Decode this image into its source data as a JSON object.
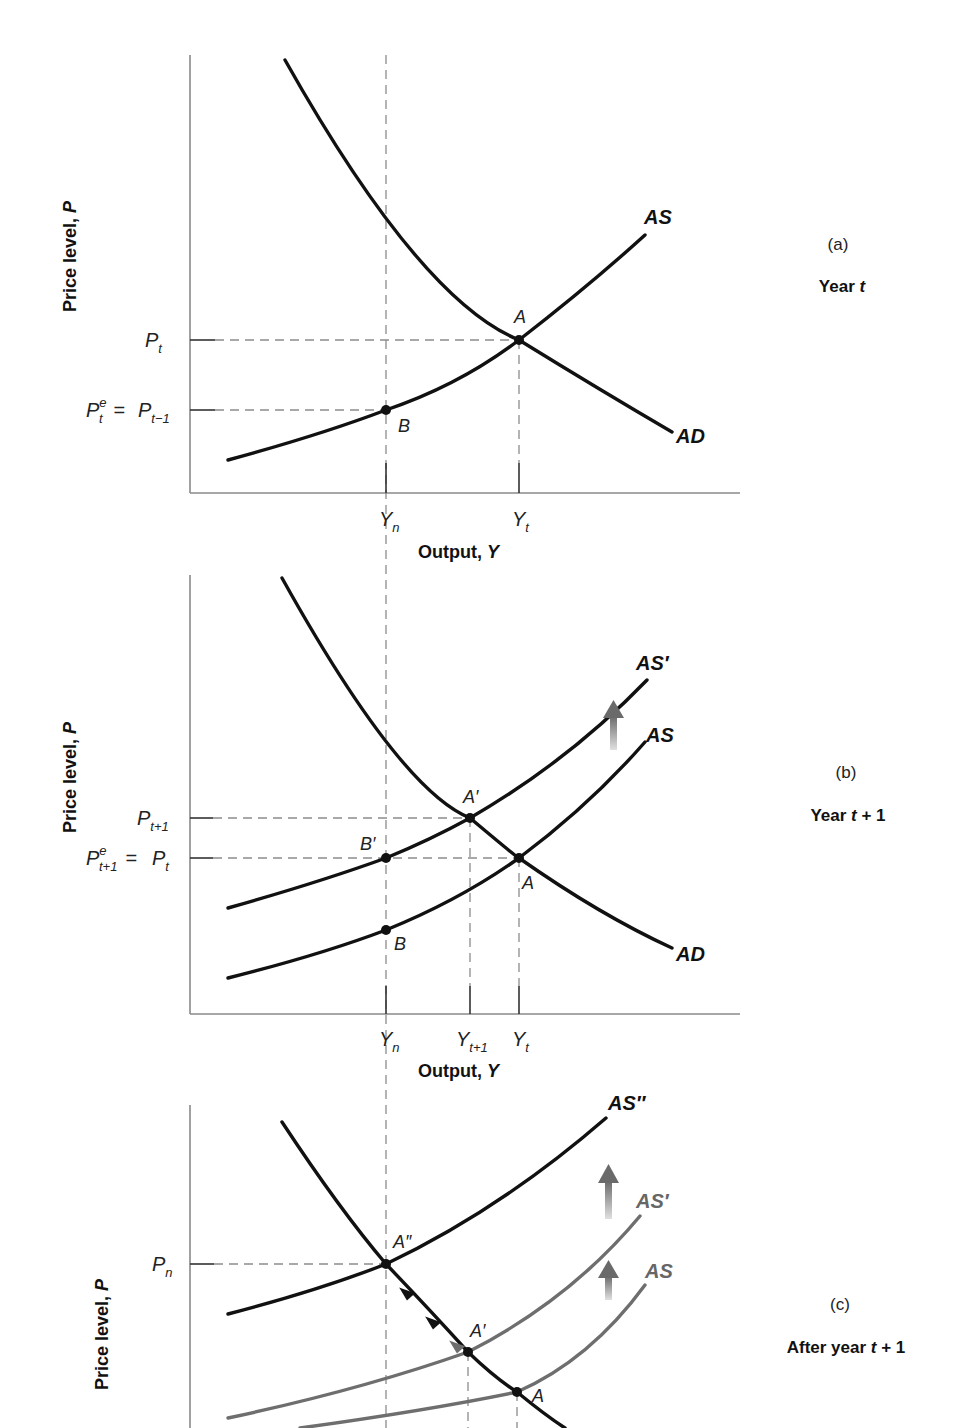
{
  "panels": [
    {
      "id": "a",
      "panel_label": "(a)",
      "caption_pre": "Year ",
      "caption_var": "t",
      "caption_post": "",
      "y_axis_label": "Price level, ",
      "y_axis_var": "P",
      "x_axis_label": "Output, ",
      "x_axis_var": "Y",
      "y_ticks": [
        {
          "name": "P_t",
          "main": "P",
          "sub": "t"
        },
        {
          "name": "P^e_t = P_{t-1}",
          "main": "P",
          "sup": "e",
          "sub": "t",
          "eq": " = ",
          "main2": "P",
          "sub2": "t−1"
        }
      ],
      "x_ticks": [
        {
          "name": "Y_n",
          "main": "Y",
          "sub": "n"
        },
        {
          "name": "Y_t",
          "main": "Y",
          "sub": "t"
        }
      ],
      "curves": [
        {
          "label": "AS",
          "color": "#111111"
        },
        {
          "label": "AD",
          "color": "#111111"
        }
      ],
      "points": [
        {
          "label": "A"
        },
        {
          "label": "B"
        }
      ]
    },
    {
      "id": "b",
      "panel_label": "(b)",
      "caption_pre": "Year ",
      "caption_var": "t",
      "caption_post": " + 1",
      "y_axis_label": "Price level, ",
      "y_axis_var": "P",
      "x_axis_label": "Output, ",
      "x_axis_var": "Y",
      "y_ticks": [
        {
          "name": "P_{t+1}",
          "main": "P",
          "sub": "t+1"
        },
        {
          "name": "P^e_{t+1} = P_t",
          "main": "P",
          "sup": "e",
          "sub": "t+1",
          "eq": " = ",
          "main2": "P",
          "sub2": "t"
        }
      ],
      "x_ticks": [
        {
          "name": "Y_n",
          "main": "Y",
          "sub": "n"
        },
        {
          "name": "Y_{t+1}",
          "main": "Y",
          "sub": "t+1"
        },
        {
          "name": "Y_t",
          "main": "Y",
          "sub": "t"
        }
      ],
      "curves": [
        {
          "label": "AS′",
          "color": "#111111"
        },
        {
          "label": "AS",
          "color": "#111111"
        },
        {
          "label": "AD",
          "color": "#111111"
        }
      ],
      "points": [
        {
          "label": "A′"
        },
        {
          "label": "B′"
        },
        {
          "label": "A"
        },
        {
          "label": "B"
        }
      ]
    },
    {
      "id": "c",
      "panel_label": "(c)",
      "caption_pre": "After year ",
      "caption_var": "t",
      "caption_post": " + 1",
      "y_axis_label": "Price level, ",
      "y_axis_var": "P",
      "y_ticks": [
        {
          "name": "P_n",
          "main": "P",
          "sub": "n"
        }
      ],
      "curves": [
        {
          "label": "AS″",
          "color": "#111111"
        },
        {
          "label": "AS′",
          "color": "#6e6e6e"
        },
        {
          "label": "AS",
          "color": "#6e6e6e"
        }
      ],
      "points": [
        {
          "label": "A″"
        },
        {
          "label": "A′"
        },
        {
          "label": "A"
        }
      ]
    }
  ],
  "colors": {
    "curve": "#111111",
    "curve_faded": "#6e6e6e",
    "axis": "#8a8a8a",
    "dash": "#8c8c8c",
    "shift_arrow": "#777777"
  }
}
